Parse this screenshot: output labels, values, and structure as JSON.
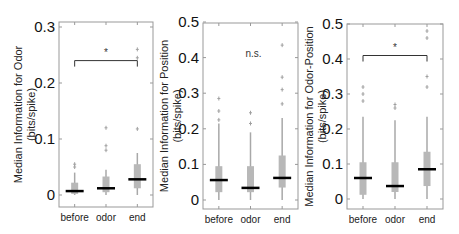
{
  "colors": {
    "box": "#b8b8b8",
    "whisker": "#a8a8a8",
    "median": "#000000",
    "outlier": "#a0a0a0",
    "axis": "#999999",
    "bracket": "#333333"
  },
  "chart_data": [
    {
      "type": "box",
      "title": "",
      "ylabel": "Median Information for Odor (bits/spike)",
      "ylabel_lines": [
        "Median Information for Odor",
        "(bits/spike)"
      ],
      "xlabel": "",
      "categories": [
        "before",
        "odor",
        "end"
      ],
      "ylim": [
        -0.022,
        0.305
      ],
      "yticks": [
        0,
        0.1,
        0.2,
        0.3
      ],
      "ytick_labels": [
        "0",
        "0.1",
        "0.2",
        "0.3"
      ],
      "grid": false,
      "boxes": [
        {
          "category": "before",
          "median": 0.007,
          "q1": 0.002,
          "q3": 0.022,
          "whisker_low": 0.0,
          "whisker_high": 0.04,
          "outliers": [
            0.05,
            0.055
          ]
        },
        {
          "category": "odor",
          "median": 0.012,
          "q1": 0.005,
          "q3": 0.033,
          "whisker_low": 0.0,
          "whisker_high": 0.045,
          "outliers": [
            0.08,
            0.088,
            0.12
          ]
        },
        {
          "category": "end",
          "median": 0.028,
          "q1": 0.012,
          "q3": 0.055,
          "whisker_low": 0.0,
          "whisker_high": 0.075,
          "outliers": [
            0.118,
            0.245,
            0.26
          ]
        }
      ],
      "significance": {
        "label": "*",
        "from": "before",
        "to": "end",
        "y": 0.24
      }
    },
    {
      "type": "box",
      "title": "",
      "ylabel": "Median Information for Position (bits/spike)",
      "ylabel_lines": [
        "Median Information for Position",
        "(bits/spike)"
      ],
      "xlabel": "",
      "categories": [
        "before",
        "odor",
        "end"
      ],
      "ylim": [
        -0.025,
        0.5
      ],
      "yticks": [
        0,
        0.1,
        0.2,
        0.3,
        0.4,
        0.5
      ],
      "ytick_labels": [
        "0",
        "0.1",
        "0.2",
        "0.3",
        "0.4",
        "0.5"
      ],
      "grid": false,
      "boxes": [
        {
          "category": "before",
          "median": 0.056,
          "q1": 0.022,
          "q3": 0.095,
          "whisker_low": 0.0,
          "whisker_high": 0.215,
          "outliers": [
            0.225,
            0.25,
            0.285
          ]
        },
        {
          "category": "odor",
          "median": 0.034,
          "q1": 0.022,
          "q3": 0.095,
          "whisker_low": 0.0,
          "whisker_high": 0.19,
          "outliers": [
            0.215,
            0.245
          ]
        },
        {
          "category": "end",
          "median": 0.062,
          "q1": 0.035,
          "q3": 0.125,
          "whisker_low": 0.0,
          "whisker_high": 0.23,
          "outliers": [
            0.27,
            0.31,
            0.345,
            0.435
          ]
        }
      ],
      "significance": {
        "label": "n.s.",
        "y": 0.41
      }
    },
    {
      "type": "box",
      "title": "",
      "ylabel": "Median Information for Odor-Position (bits/spike)",
      "ylabel_lines": [
        "Median Information for Odor-Position",
        "(bits/spike)"
      ],
      "xlabel": "",
      "categories": [
        "before",
        "odor",
        "end"
      ],
      "ylim": [
        -0.028,
        0.5
      ],
      "yticks": [
        0,
        0.1,
        0.2,
        0.3,
        0.4,
        0.5
      ],
      "ytick_labels": [
        "0",
        "0.1",
        "0.2",
        "0.3",
        "0.4",
        "0.5"
      ],
      "grid": false,
      "boxes": [
        {
          "category": "before",
          "median": 0.06,
          "q1": 0.012,
          "q3": 0.105,
          "whisker_low": 0.0,
          "whisker_high": 0.235,
          "outliers": [
            0.28,
            0.3,
            0.32
          ]
        },
        {
          "category": "odor",
          "median": 0.037,
          "q1": 0.02,
          "q3": 0.105,
          "whisker_low": 0.0,
          "whisker_high": 0.225,
          "outliers": [
            0.26,
            0.27
          ]
        },
        {
          "category": "end",
          "median": 0.085,
          "q1": 0.037,
          "q3": 0.135,
          "whisker_low": 0.0,
          "whisker_high": 0.235,
          "outliers": [
            0.32,
            0.35,
            0.46,
            0.48
          ]
        }
      ],
      "significance": {
        "label": "*",
        "from": "before",
        "to": "end",
        "y": 0.41
      }
    }
  ]
}
